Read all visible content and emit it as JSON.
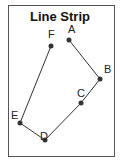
{
  "title": "Line Strip",
  "colors": {
    "frame": "#555555",
    "line": "#333333",
    "point": "#333333",
    "background": "#ffffff"
  },
  "points": [
    {
      "label": "A",
      "x": 69,
      "y": 40
    },
    {
      "label": "B",
      "x": 100,
      "y": 79
    },
    {
      "label": "C",
      "x": 81,
      "y": 103
    },
    {
      "label": "D",
      "x": 45,
      "y": 140
    },
    {
      "label": "E",
      "x": 20,
      "y": 123
    },
    {
      "label": "F",
      "x": 51,
      "y": 46
    }
  ]
}
